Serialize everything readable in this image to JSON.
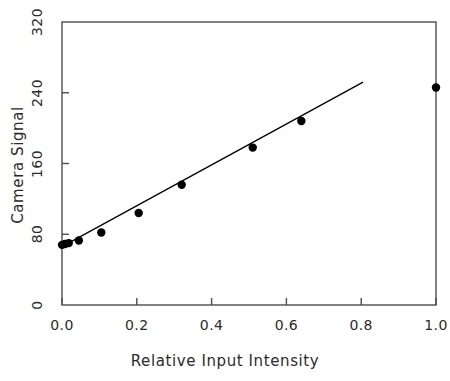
{
  "chart_data": {
    "type": "scatter",
    "title": "",
    "subtitle": "",
    "xlabel": "Relative Input Intensity",
    "ylabel": "Camera Signal",
    "xlim": [
      0.0,
      1.0
    ],
    "ylim": [
      0,
      320
    ],
    "xticks": [
      0.0,
      0.2,
      0.4,
      0.6,
      0.8,
      1.0
    ],
    "xtick_labels": [
      "0.0",
      "0.2",
      "0.4",
      "0.6",
      "0.8",
      "1.0"
    ],
    "yticks": [
      0,
      80,
      160,
      240,
      320
    ],
    "ytick_labels": [
      "0",
      "80",
      "160",
      "240",
      "320"
    ],
    "grid": false,
    "legend": null,
    "marker": "filled-circle",
    "marker_color": "#000000",
    "line_color": "#000000",
    "frame_color": "#4d4d4d",
    "background": "#ffffff",
    "x": [
      0.0,
      0.008,
      0.018,
      0.045,
      0.105,
      0.205,
      0.32,
      0.51,
      0.64,
      1.0
    ],
    "y": [
      68,
      69,
      70,
      73,
      82,
      104,
      136,
      178,
      208,
      246
    ],
    "series": [
      {
        "name": "Camera response",
        "type": "scatter",
        "x": [
          0.0,
          0.008,
          0.018,
          0.045,
          0.105,
          0.205,
          0.32,
          0.51,
          0.64,
          1.0
        ],
        "values": [
          68,
          69,
          70,
          73,
          82,
          104,
          136,
          178,
          208,
          246
        ]
      },
      {
        "name": "Linear fit",
        "type": "line",
        "x": [
          0.0,
          0.805
        ],
        "values": [
          66,
          252
        ]
      }
    ],
    "annotations": []
  },
  "axis": {
    "x_title": "Relative Input Intensity",
    "y_title": "Camera Signal"
  }
}
